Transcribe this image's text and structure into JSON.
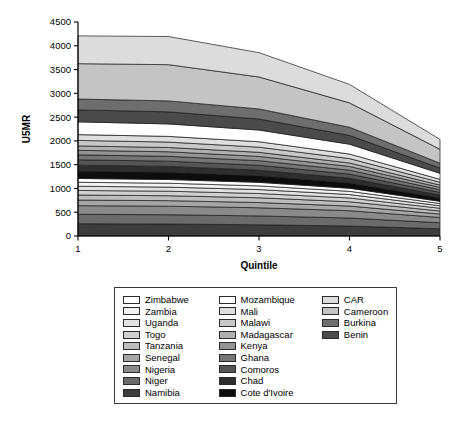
{
  "chart_data": {
    "type": "area",
    "title": "",
    "xlabel": "Quintile",
    "ylabel": "U5MR",
    "x": [
      1,
      2,
      3,
      4,
      5
    ],
    "xtick_labels": [
      "1",
      "2",
      "3",
      "4",
      "5"
    ],
    "ytick_labels": [
      "0",
      "500",
      "1000",
      "1500",
      "2000",
      "2500",
      "3000",
      "3500",
      "4000",
      "4500"
    ],
    "ytick_values": [
      0,
      500,
      1000,
      1500,
      2000,
      2500,
      3000,
      3500,
      4000,
      4500
    ],
    "ylim": [
      0,
      4500
    ],
    "xlim": [
      1,
      5
    ],
    "grid": false,
    "stacked": true,
    "legend_position": "below",
    "legend_columns": 3,
    "series": [
      {
        "name": "Namibia",
        "color": "#3d3d3d",
        "values": [
          258,
          252,
          236,
          210,
          152
        ]
      },
      {
        "name": "Niger",
        "color": "#6b6b6b",
        "values": [
          198,
          195,
          186,
          168,
          126
        ]
      },
      {
        "name": "Nigeria",
        "color": "#8a8a8a",
        "values": [
          182,
          180,
          172,
          154,
          112
        ]
      },
      {
        "name": "Senegal",
        "color": "#a5a5a5",
        "values": [
          118,
          116,
          110,
          98,
          72
        ]
      },
      {
        "name": "Tanzania",
        "color": "#bdbdbd",
        "values": [
          106,
          104,
          100,
          90,
          64
        ]
      },
      {
        "name": "Togo",
        "color": "#d0d0d0",
        "values": [
          96,
          95,
          90,
          80,
          58
        ]
      },
      {
        "name": "Uganda",
        "color": "#e2e2e2",
        "values": [
          88,
          86,
          82,
          72,
          52
        ]
      },
      {
        "name": "Zambia",
        "color": "#f2f2f2",
        "values": [
          84,
          82,
          78,
          68,
          48
        ]
      },
      {
        "name": "Zimbabwe",
        "color": "#ffffff",
        "values": [
          80,
          78,
          74,
          64,
          46
        ]
      },
      {
        "name": "Cote d'Ivoire",
        "color": "#0d0d0d",
        "values": [
          152,
          150,
          138,
          112,
          70
        ]
      },
      {
        "name": "Chad",
        "color": "#2e2e2e",
        "values": [
          128,
          126,
          118,
          98,
          62
        ]
      },
      {
        "name": "Comoros",
        "color": "#555555",
        "values": [
          112,
          110,
          104,
          88,
          56
        ]
      },
      {
        "name": "Ghana",
        "color": "#757575",
        "values": [
          104,
          102,
          96,
          82,
          54
        ]
      },
      {
        "name": "Kenya",
        "color": "#949494",
        "values": [
          96,
          95,
          90,
          78,
          50
        ]
      },
      {
        "name": "Madagascar",
        "color": "#b0b0b0",
        "values": [
          92,
          90,
          86,
          74,
          48
        ]
      },
      {
        "name": "Malawi",
        "color": "#c8c8c8",
        "values": [
          116,
          114,
          108,
          92,
          60
        ]
      },
      {
        "name": "Mali",
        "color": "#dedede",
        "values": [
          122,
          120,
          114,
          96,
          62
        ]
      },
      {
        "name": "Mozambique",
        "color": "#ffffff",
        "values": [
          268,
          262,
          246,
          206,
          126
        ]
      },
      {
        "name": "Benin",
        "color": "#4a4a4a",
        "values": [
          252,
          254,
          232,
          186,
          110
        ]
      },
      {
        "name": "Burkina",
        "color": "#6e6e6e",
        "values": [
          228,
          230,
          212,
          172,
          104
        ]
      },
      {
        "name": "Cameroon",
        "color": "#c4c4c4",
        "values": [
          744,
          762,
          672,
          512,
          290
        ]
      },
      {
        "name": "CAR",
        "color": "#dcdcdc",
        "values": [
          584,
          592,
          512,
          388,
          208
        ]
      }
    ],
    "stack_totals": [
      4210,
      4215,
      3862,
      3118,
      2480
    ]
  },
  "legend": {
    "columns": [
      {
        "items": [
          {
            "label": "Zimbabwe",
            "color": "#ffffff"
          },
          {
            "label": "Zambia",
            "color": "#f2f2f2"
          },
          {
            "label": "Uganda",
            "color": "#e2e2e2"
          },
          {
            "label": "Togo",
            "color": "#d0d0d0"
          },
          {
            "label": "Tanzania",
            "color": "#bdbdbd"
          },
          {
            "label": "Senegal",
            "color": "#a5a5a5"
          },
          {
            "label": "Nigeria",
            "color": "#8a8a8a"
          },
          {
            "label": "Niger",
            "color": "#6b6b6b"
          },
          {
            "label": "Namibia",
            "color": "#3d3d3d"
          }
        ]
      },
      {
        "items": [
          {
            "label": "Mozambique",
            "color": "#ffffff"
          },
          {
            "label": "Mali",
            "color": "#dedede"
          },
          {
            "label": "Malawi",
            "color": "#c8c8c8"
          },
          {
            "label": "Madagascar",
            "color": "#b0b0b0"
          },
          {
            "label": "Kenya",
            "color": "#949494"
          },
          {
            "label": "Ghana",
            "color": "#757575"
          },
          {
            "label": "Comoros",
            "color": "#555555"
          },
          {
            "label": "Chad",
            "color": "#2e2e2e"
          },
          {
            "label": "Cote d'Ivoire",
            "color": "#0d0d0d"
          }
        ]
      },
      {
        "items": [
          {
            "label": "CAR",
            "color": "#dcdcdc"
          },
          {
            "label": "Cameroon",
            "color": "#c4c4c4"
          },
          {
            "label": "Burkina",
            "color": "#6e6e6e"
          },
          {
            "label": "Benin",
            "color": "#4a4a4a"
          }
        ]
      }
    ]
  }
}
